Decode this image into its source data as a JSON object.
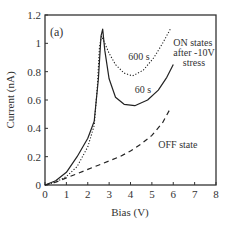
{
  "chart_data": {
    "type": "line",
    "title": "",
    "panel_label": "(a)",
    "xlabel": "Bias (V)",
    "ylabel": "Current (nA)",
    "xlim": [
      0,
      8
    ],
    "ylim": [
      0,
      1.2
    ],
    "x_ticks": [
      0,
      1,
      2,
      3,
      4,
      5,
      6,
      7,
      8
    ],
    "y_ticks": [
      0,
      0.2,
      0.4,
      0.6,
      0.8,
      1,
      1.2
    ],
    "x_tick_labels": [
      "0",
      "1",
      "2",
      "3",
      "4",
      "5",
      "6",
      "7",
      "8"
    ],
    "y_tick_labels": [
      "0",
      "0.2",
      "0.4",
      "0.6",
      "0.8",
      "1",
      "1.2"
    ],
    "grid": false,
    "legend": "none (inline annotations)",
    "series": [
      {
        "name": "60 s",
        "style": "solid",
        "x": [
          0,
          0.5,
          1.0,
          1.5,
          2.0,
          2.3,
          2.5,
          2.62,
          2.7,
          2.8,
          3.0,
          3.3,
          3.7,
          4.2,
          4.8,
          5.3,
          5.7,
          6.0
        ],
        "y": [
          0,
          0.03,
          0.09,
          0.2,
          0.33,
          0.45,
          0.75,
          1.05,
          1.1,
          0.95,
          0.75,
          0.62,
          0.57,
          0.56,
          0.6,
          0.67,
          0.76,
          0.85
        ]
      },
      {
        "name": "600 s",
        "style": "dotted",
        "x": [
          0,
          0.5,
          1.0,
          1.5,
          2.0,
          2.3,
          2.45,
          2.55,
          2.65,
          2.8,
          3.0,
          3.3,
          3.7,
          4.1,
          4.6,
          5.1,
          5.5,
          5.9
        ],
        "y": [
          0,
          0.02,
          0.06,
          0.13,
          0.27,
          0.42,
          0.7,
          0.98,
          1.05,
          1.0,
          0.93,
          0.85,
          0.79,
          0.77,
          0.81,
          0.9,
          1.0,
          1.11
        ]
      },
      {
        "name": "OFF state",
        "style": "dashed",
        "x": [
          0,
          0.5,
          1.0,
          1.5,
          2.0,
          2.5,
          3.0,
          3.5,
          4.0,
          4.5,
          5.0,
          5.5,
          5.9
        ],
        "y": [
          0,
          0.02,
          0.05,
          0.08,
          0.11,
          0.14,
          0.17,
          0.2,
          0.24,
          0.29,
          0.35,
          0.44,
          0.55
        ]
      }
    ],
    "annotations": [
      {
        "text": "600 s",
        "x": 3.9,
        "y": 0.88
      },
      {
        "text": "60 s",
        "x": 4.2,
        "y": 0.65
      },
      {
        "text": "ON states",
        "x": 6.0,
        "y": 0.98
      },
      {
        "text": "after -10V",
        "x": 6.0,
        "y": 0.91
      },
      {
        "text": "stress",
        "x": 6.45,
        "y": 0.84
      },
      {
        "text": "OFF state",
        "x": 5.3,
        "y": 0.26
      }
    ]
  },
  "colors": {
    "axis": "#333333",
    "line": "#222222",
    "background": "#ffffff"
  }
}
